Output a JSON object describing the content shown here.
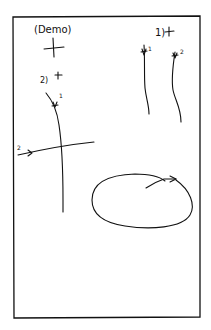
{
  "diagram": {
    "type": "hand-drawn gesture sketch",
    "stroke_color": "#111111",
    "background_color": "#ffffff",
    "labels": {
      "demo": "(Demo)",
      "group_1": "1)",
      "group_2": "2)",
      "stroke_1a": "1",
      "stroke_1b": "2",
      "stroke_2a": "1",
      "stroke_2b": "2"
    },
    "elements": [
      {
        "name": "demo-crosshair",
        "description": "plus/crosshair marker under (Demo) label"
      },
      {
        "name": "gesture-1",
        "description": "1) two parallel wavy vertical strokes, labeled 1 and 2, each starting at a cross marker"
      },
      {
        "name": "gesture-2",
        "description": "2) a vertical stroke (1) crossed by a horizontal stroke (2)"
      },
      {
        "name": "gesture-loop",
        "description": "closed ellipse with arrowhead indicating circular motion"
      }
    ]
  }
}
